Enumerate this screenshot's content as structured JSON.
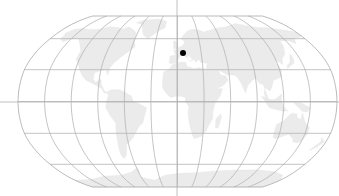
{
  "map": {
    "projection": "robinson",
    "graticule_step_deg": 30,
    "colors": {
      "background": "#ffffff",
      "land": "#ebebeb",
      "graticule": "#b4b4b4",
      "crosshair": "#b0b0b0",
      "marker": "#000000"
    },
    "crosshair": {
      "x": 177,
      "y": 102
    },
    "marker": {
      "label": "",
      "x": 183,
      "y": 53,
      "radius": 3
    }
  }
}
